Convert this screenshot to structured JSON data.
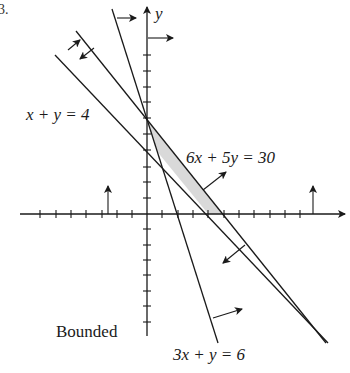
{
  "figure": {
    "number_fragment": "3.",
    "caption_label": "Bounded",
    "axis_labels": {
      "y": "y"
    },
    "colors": {
      "line": "#1a1a1a",
      "feasible_fill": "#d9d9d9",
      "background": "#ffffff"
    }
  },
  "constraints": [
    {
      "id": "c1",
      "label": "x + y = 4",
      "equation": "x + y = 4",
      "direction": "up-right"
    },
    {
      "id": "c2",
      "label": "6x + 5y = 30",
      "equation": "6x + 5y = 30",
      "direction": "down-left"
    },
    {
      "id": "c3",
      "label": "3x + y = 6",
      "equation": "3x + y = 6",
      "direction": "right"
    },
    {
      "id": "c4",
      "label": "x ≥ 0",
      "equation": "x = 0",
      "direction": "right"
    },
    {
      "id": "c5",
      "label": "y ≥ 0",
      "equation": "y = 0",
      "direction": "up"
    }
  ],
  "feasible_region": {
    "vertices": [
      [
        0,
        6
      ],
      [
        0.6667,
        4.0
      ],
      [
        4,
        0
      ],
      [
        5,
        0
      ]
    ],
    "note": "Bounded"
  },
  "axes": {
    "x_ticks": [
      -7,
      -6,
      -5,
      -4,
      -3,
      -2,
      -1,
      1,
      2,
      3,
      4,
      5,
      6,
      7,
      8,
      9,
      10
    ],
    "y_ticks": [
      -8,
      -7,
      -6,
      -5,
      -4,
      -3,
      -2,
      -1,
      1,
      2,
      3,
      4,
      5,
      6,
      7,
      8,
      9,
      10
    ]
  }
}
